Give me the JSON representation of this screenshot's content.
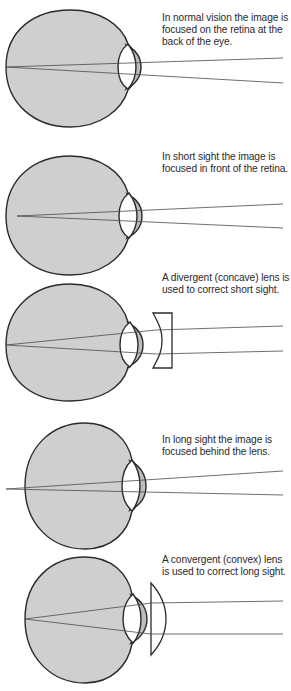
{
  "panels": [
    {
      "id": "normal",
      "caption": "In normal vision the image is focused on the retina at the back of the eye.",
      "focus": "on-retina",
      "corrective_lens": "none"
    },
    {
      "id": "short-sight",
      "caption": "In short sight the image is focused in front of the retina.",
      "focus": "in-front-of-retina",
      "corrective_lens": "none"
    },
    {
      "id": "short-sight-corrected",
      "caption": "A divergent (concave) lens is used to correct short sight.",
      "focus": "on-retina",
      "corrective_lens": "concave"
    },
    {
      "id": "long-sight",
      "caption": "In long sight the image is focused behind the lens.",
      "focus": "behind-retina",
      "corrective_lens": "none"
    },
    {
      "id": "long-sight-corrected",
      "caption": "A convergent (convex) lens is used to correct long sight.",
      "focus": "on-retina",
      "corrective_lens": "convex"
    }
  ],
  "colors": {
    "eye_fill": "#cfcfcf",
    "cornea_fill": "#bdbdbd",
    "outline": "#2b2b2b",
    "ray": "#4a4a4a",
    "text": "#2a2a2a"
  }
}
